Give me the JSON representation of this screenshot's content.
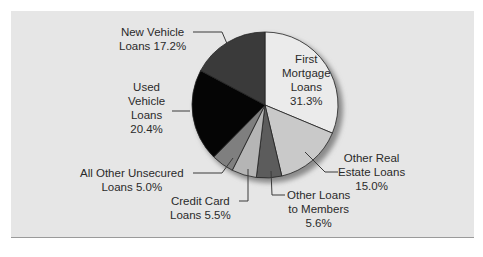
{
  "chart_data": {
    "type": "pie",
    "title": "",
    "start_angle_deg": 0,
    "direction": "clockwise",
    "categories": [
      "First Mortgage Loans",
      "Other Real Estate Loans",
      "Other Loans to Members",
      "Credit Card Loans",
      "All Other Unsecured Loans",
      "Used Vehicle Loans",
      "New Vehicle Loans"
    ],
    "values": [
      31.3,
      15.0,
      5.6,
      5.5,
      5.0,
      20.4,
      17.2
    ],
    "unit": "%",
    "colors": [
      "#ebebeb",
      "#c9c9c9",
      "#5c5c5c",
      "#b5b5b5",
      "#7f7f7f",
      "#050505",
      "#3a3a3a"
    ],
    "legend": "none (callout labels)"
  },
  "labels": {
    "first_mortgage": [
      "First",
      "Mortgage",
      "Loans",
      "31.3%"
    ],
    "other_real_estate": [
      "Other Real",
      "Estate Loans",
      "15.0%"
    ],
    "other_loans_members": [
      "Other Loans",
      "to Members",
      "5.6%"
    ],
    "credit_card": [
      "Credit Card",
      "Loans 5.5%"
    ],
    "all_other_unsecured": [
      "All Other Unsecured",
      "Loans 5.0%"
    ],
    "used_vehicle": [
      "Used",
      "Vehicle",
      "Loans",
      "20.4%"
    ],
    "new_vehicle": [
      "New Vehicle",
      "Loans 17.2%"
    ]
  }
}
